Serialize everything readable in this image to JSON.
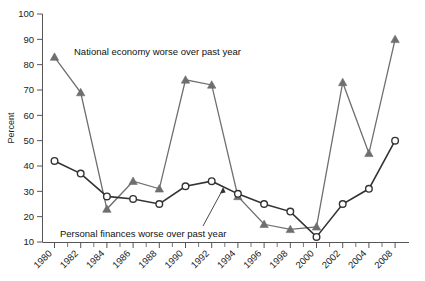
{
  "chart_data": {
    "type": "line",
    "title": "",
    "xlabel": "",
    "ylabel": "Percent",
    "ylim": [
      10,
      100
    ],
    "ytick_values": [
      10,
      20,
      30,
      40,
      50,
      60,
      70,
      80,
      90,
      100
    ],
    "ytick_labels": [
      "10",
      "20",
      "30",
      "40",
      "50",
      "60",
      "70",
      "80",
      "90",
      "100"
    ],
    "grid": false,
    "legend_position": "inline-annotations",
    "categories": [
      "1980",
      "1982",
      "1984",
      "1986",
      "1988",
      "1990",
      "1992",
      "1994",
      "1996",
      "1998",
      "2000",
      "2002",
      "2004",
      "2008"
    ],
    "x_tick_labels": [
      "1980",
      "1982",
      "1984",
      "1986",
      "1988",
      "1990",
      "1992",
      "1994",
      "1996",
      "1998",
      "2000",
      "2002",
      "2004",
      "2008"
    ],
    "series": [
      {
        "name": "National economy worse over past year",
        "marker": "triangle",
        "color": "#6e6e6e",
        "values": [
          83,
          69,
          23,
          34,
          31,
          74,
          72,
          28,
          17,
          15,
          16,
          73,
          45,
          90
        ]
      },
      {
        "name": "Personal finances worse over past year",
        "marker": "circle",
        "color": "#333333",
        "values": [
          42,
          37,
          28,
          27,
          25,
          32,
          34,
          29,
          25,
          22,
          12,
          25,
          31,
          50
        ]
      }
    ],
    "annotations": [
      {
        "text": "National economy worse over past year",
        "anchor": "upper-left",
        "points_to": "1980"
      },
      {
        "text": "Personal finances worse over past year",
        "anchor": "lower-left",
        "points_to": "1992"
      }
    ],
    "colors": {
      "national_economy_line": "#6e6e6e",
      "personal_finances_line": "#333333",
      "axis": "#555555",
      "background": "#ffffff",
      "text": "#111111"
    }
  }
}
